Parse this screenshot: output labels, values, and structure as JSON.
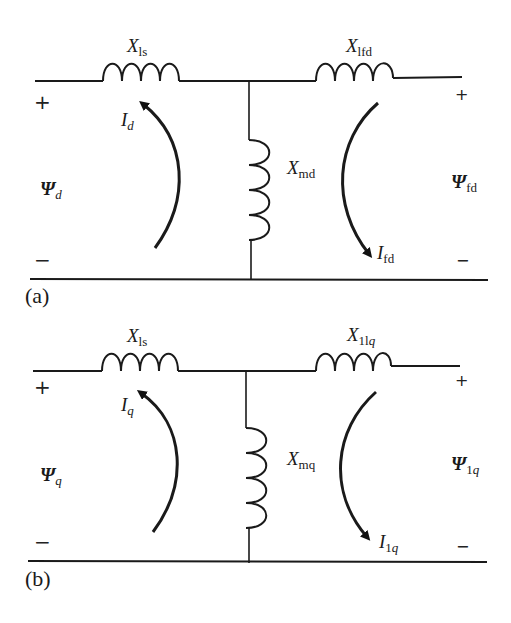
{
  "figure": {
    "panels": [
      {
        "id": "a",
        "caption": "(a)",
        "series_reactance": {
          "base": "X",
          "sub": "ls"
        },
        "magnetizing_reactance": {
          "base": "X",
          "sub": "md"
        },
        "rotor_reactance": {
          "base": "X",
          "sub": "lfd"
        },
        "stator_current": {
          "base": "I",
          "sub": "d"
        },
        "rotor_current": {
          "base": "I",
          "sub": "fd"
        },
        "stator_flux": {
          "base": "Ψ",
          "sub": "d"
        },
        "rotor_flux": {
          "base": "Ψ",
          "sub": "fd"
        },
        "left_plus": "+",
        "left_minus": "−",
        "right_plus": "+",
        "right_minus": "−"
      },
      {
        "id": "b",
        "caption": "(b)",
        "series_reactance": {
          "base": "X",
          "sub": "ls"
        },
        "magnetizing_reactance": {
          "base": "X",
          "sub": "mq"
        },
        "rotor_reactance": {
          "base": "X",
          "sub_upright": "1l",
          "sub_italic": "q"
        },
        "stator_current": {
          "base": "I",
          "sub": "q"
        },
        "rotor_current": {
          "base": "I",
          "sub_upright": "1",
          "sub_italic": "q"
        },
        "stator_flux": {
          "base": "Ψ",
          "sub": "q"
        },
        "rotor_flux": {
          "base": "Ψ",
          "sub_upright": "1",
          "sub_italic": "q"
        },
        "left_plus": "+",
        "left_minus": "−",
        "right_plus": "+",
        "right_minus": "−"
      }
    ],
    "colors": {
      "line": "#1a1a1a",
      "background": "#ffffff"
    }
  }
}
